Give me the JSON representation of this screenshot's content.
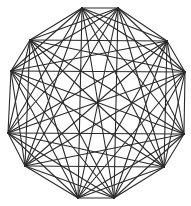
{
  "diagram": {
    "type": "complete-graph",
    "name": "K12",
    "vertex_count": 12,
    "edge_count": 66,
    "stroke_color": "#2a2a2a",
    "background": "#ffffff",
    "vertices": [
      [
        82,
        8
      ],
      [
        118,
        8
      ],
      [
        167,
        41
      ],
      [
        185,
        72
      ],
      [
        184,
        134
      ],
      [
        164,
        167
      ],
      [
        114,
        198
      ],
      [
        78,
        198
      ],
      [
        25,
        166
      ],
      [
        8,
        133
      ],
      [
        11,
        71
      ],
      [
        30,
        40
      ]
    ]
  }
}
